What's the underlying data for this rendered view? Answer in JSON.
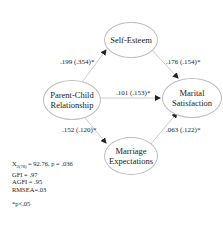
{
  "nodes": {
    "self_esteem": "Self-Esteem",
    "parent_child": [
      "Parent-Child",
      "Relationship"
    ],
    "marital": [
      "Marital",
      "Satisfaction"
    ],
    "expectations": [
      "Marriage",
      "Expectations"
    ]
  },
  "paths": {
    "pc_to_se": ".199 (.354)*",
    "se_to_ms": ".176 (.154)*",
    "pc_to_ms": ".101 (.153)*",
    "pc_to_me": ".152 (.120)*",
    "me_to_ms": ".063 (.122)*"
  },
  "stats": {
    "chi_prefix": "X",
    "chi_sub": "2(78)",
    "chi_rest": " = 92.76, p = .036",
    "gfi": "GFI = .97",
    "agfi": "AGFI = .95",
    "rmsea": "RMSEA=.03",
    "note": "*p<.05"
  }
}
